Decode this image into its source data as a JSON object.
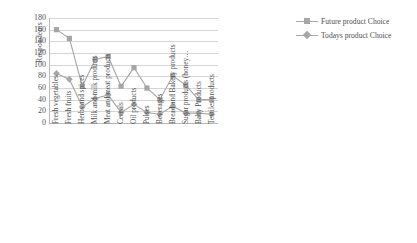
{
  "chart_data": {
    "type": "line",
    "title": "",
    "xlabel": "",
    "ylabel": "Respondents",
    "ylim": [
      0,
      180
    ],
    "ytick_step": 20,
    "yticks": [
      180,
      160,
      140,
      120,
      100,
      80,
      60,
      40,
      20,
      0
    ],
    "grid": true,
    "legend_position": "top-right",
    "categories": [
      "Fresh vegetables",
      "Fresh fruits",
      "Herbs and spices",
      "Milk and milk products",
      "Meat and meat products",
      "Cereals",
      "Oil products",
      "Pulses",
      "Beverages",
      "Bread and Bakery products",
      "Sugar products (honey…",
      "Baby Products",
      "Textiles products"
    ],
    "series": [
      {
        "name": "Future product Choice",
        "marker": "square",
        "color": "#a6a6a6",
        "values": [
          160,
          145,
          63,
          109,
          114,
          63,
          95,
          60,
          40,
          81,
          65,
          40,
          40
        ]
      },
      {
        "name": "Todays product Choice",
        "marker": "diamond",
        "color": "#a6a6a6",
        "values": [
          85,
          75,
          28,
          42,
          48,
          18,
          32,
          18,
          15,
          29,
          17,
          17,
          15
        ]
      }
    ]
  },
  "axis": {
    "y_title": "Respondents"
  },
  "legend": {
    "items": [
      {
        "label": "Future product Choice",
        "marker": "square"
      },
      {
        "label": "Todays product Choice",
        "marker": "diamond"
      }
    ]
  }
}
